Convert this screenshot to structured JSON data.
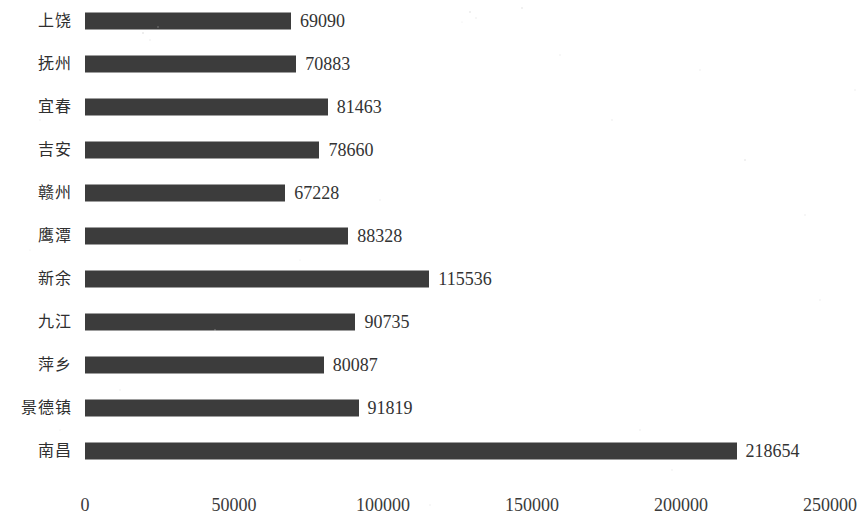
{
  "chart_data": {
    "type": "bar",
    "orientation": "horizontal",
    "title": "",
    "subtitle": "",
    "xlabel": "",
    "ylabel": "",
    "grid": false,
    "legend": null,
    "xlim": [
      0,
      250000
    ],
    "xticks": [
      "0",
      "50000",
      "100000",
      "150000",
      "200000",
      "250000"
    ],
    "xtick_values": [
      0,
      50000,
      100000,
      150000,
      200000,
      250000
    ],
    "categories": [
      "上饶",
      "抚州",
      "宜春",
      "吉安",
      "赣州",
      "鹰潭",
      "新余",
      "九江",
      "萍乡",
      "景德镇",
      "南昌"
    ],
    "values": [
      69090,
      70883,
      81463,
      78660,
      67228,
      88328,
      115536,
      90735,
      80087,
      91819,
      218654
    ],
    "value_labels": [
      "69090",
      "70883",
      "81463",
      "78660",
      "67228",
      "88328",
      "115536",
      "90735",
      "80087",
      "91819",
      "218654"
    ],
    "bar_color": "#3c3c3c"
  }
}
